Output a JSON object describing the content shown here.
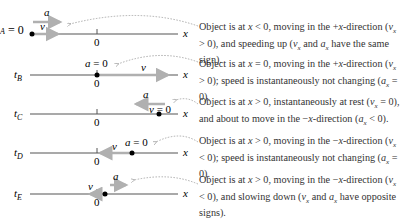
{
  "figure": {
    "axis_label": "x",
    "origin_label": "0",
    "rows": [
      {
        "time_label": "t",
        "time_sub": "A",
        "left_label": "A = 0",
        "velocity_label": "v",
        "acceleration_label": "a",
        "description": "Object is at x < 0, moving in the +x-direction (vx > 0), and speeding up (vx and ax have the same sign)."
      },
      {
        "time_label": "t",
        "time_sub": "B",
        "accel_note": "a = 0",
        "velocity_label": "v",
        "description": "Object is at x = 0, moving in the +x-direction (vx > 0); speed is instantaneously not changing (ax = 0)."
      },
      {
        "time_label": "t",
        "time_sub": "C",
        "velocity_note": "v = 0",
        "acceleration_label": "a",
        "description": "Object is at x > 0, instantaneously at rest (vx = 0), and about to move in the −x-direction (ax < 0)."
      },
      {
        "time_label": "t",
        "time_sub": "D",
        "accel_note": "a = 0",
        "velocity_label": "v",
        "description": "Object is at x > 0, moving in the −x-direction (vx < 0); speed is instantaneously not changing (ax = 0)."
      },
      {
        "time_label": "t",
        "time_sub": "E",
        "velocity_label": "v",
        "acceleration_label": "a",
        "description": "Object is at x > 0, moving in the −x-direction (vx < 0), and slowing down (vx and ax have opposite signs)."
      }
    ],
    "colors": {
      "axis": "#555555",
      "arrow": "#b0b0b0",
      "dot": "#000000",
      "leader": "#999999",
      "text": "#333333"
    }
  }
}
